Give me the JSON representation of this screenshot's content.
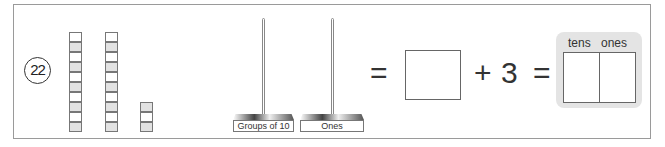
{
  "problem": {
    "number": "22",
    "blocks": {
      "tens_rods": 2,
      "ones_cubes": 3
    },
    "place_value_stands": [
      {
        "label": "Groups of 10"
      },
      {
        "label": "Ones"
      }
    ],
    "equation": {
      "equals_1": "=",
      "plus": "+",
      "addend": "3",
      "equals_2": "="
    },
    "tens_ones_box": {
      "tens_label": "tens",
      "ones_label": "ones"
    }
  }
}
